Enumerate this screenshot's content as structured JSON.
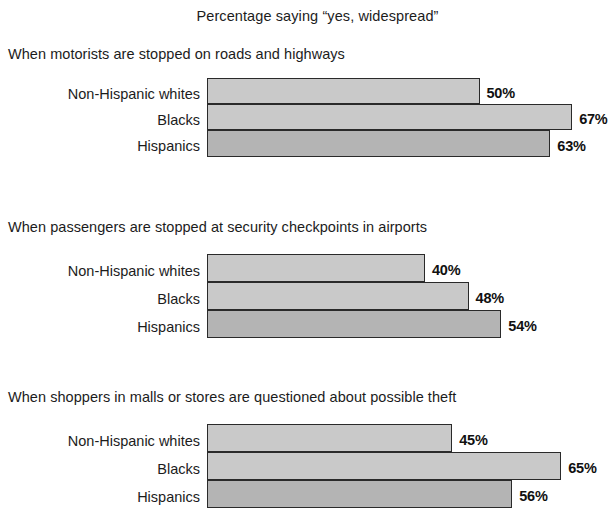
{
  "chart_data": {
    "type": "bar",
    "orientation": "horizontal",
    "title": "Percentage saying “yes, widespread”",
    "xlabel": "",
    "ylabel": "",
    "xlim": [
      0,
      75
    ],
    "grid": false,
    "legend": "none",
    "value_suffix": "%",
    "categories": [
      "Non-Hispanic whites",
      "Blacks",
      "Hispanics"
    ],
    "panels": [
      {
        "heading": "When motorists are stopped on roads and highways",
        "categories": [
          "Non-Hispanic whites",
          "Blacks",
          "Hispanics"
        ],
        "values": [
          50,
          67,
          63
        ],
        "value_labels": [
          "50%",
          "67%",
          "63%"
        ]
      },
      {
        "heading": "When passengers are stopped at security checkpoints in airports",
        "categories": [
          "Non-Hispanic whites",
          "Blacks",
          "Hispanics"
        ],
        "values": [
          40,
          48,
          54
        ],
        "value_labels": [
          "40%",
          "48%",
          "54%"
        ]
      },
      {
        "heading": "When shoppers in malls or stores are questioned about possible theft",
        "categories": [
          "Non-Hispanic whites",
          "Blacks",
          "Hispanics"
        ],
        "values": [
          45,
          65,
          56
        ],
        "value_labels": [
          "45%",
          "65%",
          "56%"
        ]
      }
    ],
    "colors": {
      "bar_light": "#c9c9c9",
      "bar_dark": "#b4b4b4",
      "bar_border": "#2a2a2a",
      "text": "#1c1c1c",
      "background": "#ffffff"
    }
  },
  "panel1": {
    "heading": "When motorists are stopped on roads and highways",
    "rows": [
      {
        "label": "Non-Hispanic whites",
        "value": "50%"
      },
      {
        "label": "Blacks",
        "value": "67%"
      },
      {
        "label": "Hispanics",
        "value": "63%"
      }
    ]
  },
  "panel2": {
    "heading": "When passengers are stopped at security checkpoints in airports",
    "rows": [
      {
        "label": "Non-Hispanic whites",
        "value": "40%"
      },
      {
        "label": "Blacks",
        "value": "48%"
      },
      {
        "label": "Hispanics",
        "value": "54%"
      }
    ]
  },
  "panel3": {
    "heading": "When shoppers in malls or stores are questioned about possible theft",
    "rows": [
      {
        "label": "Non-Hispanic whites",
        "value": "45%"
      },
      {
        "label": "Blacks",
        "value": "65%"
      },
      {
        "label": "Hispanics",
        "value": "56%"
      }
    ]
  }
}
